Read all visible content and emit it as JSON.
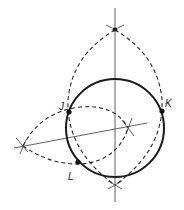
{
  "diagram": {
    "type": "geometric-construction",
    "colors": {
      "stroke": "#1a1a1a",
      "background": "#ffffff"
    },
    "points": [
      {
        "label": "J",
        "x": 69,
        "y": 112
      },
      {
        "label": "K",
        "x": 162,
        "y": 111
      },
      {
        "label": "L",
        "x": 78,
        "y": 162
      }
    ],
    "circle": {
      "cx": 115,
      "cy": 128,
      "r": 49
    },
    "labels": {
      "j": "J",
      "k": "K",
      "l": "L"
    }
  }
}
